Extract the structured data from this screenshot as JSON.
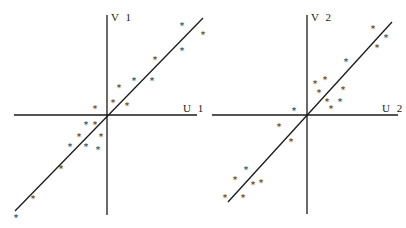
{
  "chart_data": [
    {
      "type": "scatter",
      "title": "",
      "xlabel": "U 1",
      "ylabel": "V 1",
      "grid": false,
      "legend": null,
      "axes_origin_px": [
        107,
        115
      ],
      "x_axis_px": [
        14,
        197
      ],
      "y_axis_px": [
        15,
        215
      ],
      "fit_line_px": [
        [
          15,
          211
        ],
        [
          203,
          18
        ]
      ],
      "points_px": [
        [
          182,
          25
        ],
        [
          203,
          34
        ],
        [
          182,
          50
        ],
        [
          155,
          59
        ],
        [
          134,
          80
        ],
        [
          152,
          80
        ],
        [
          119,
          87
        ],
        [
          113,
          102
        ],
        [
          127,
          105
        ],
        [
          95,
          108
        ],
        [
          86,
          124
        ],
        [
          95,
          124
        ],
        [
          79,
          136
        ],
        [
          101,
          136
        ],
        [
          70,
          146
        ],
        [
          86,
          146
        ],
        [
          98,
          149
        ],
        [
          61,
          168
        ],
        [
          33,
          198
        ],
        [
          16,
          217
        ]
      ],
      "points_relative": [
        {
          "x": 75,
          "y": 90
        },
        {
          "x": 96,
          "y": 81
        },
        {
          "x": 75,
          "y": 65
        },
        {
          "x": 48,
          "y": 56
        },
        {
          "x": 27,
          "y": 35
        },
        {
          "x": 45,
          "y": 35
        },
        {
          "x": 12,
          "y": 28
        },
        {
          "x": 6,
          "y": 13
        },
        {
          "x": 20,
          "y": 10
        },
        {
          "x": -12,
          "y": 7
        },
        {
          "x": -21,
          "y": -9
        },
        {
          "x": -12,
          "y": -9
        },
        {
          "x": -28,
          "y": -21
        },
        {
          "x": -6,
          "y": -21
        },
        {
          "x": -37,
          "y": -31
        },
        {
          "x": -21,
          "y": -31
        },
        {
          "x": -9,
          "y": -34
        },
        {
          "x": -46,
          "y": -53
        },
        {
          "x": -74,
          "y": -83
        },
        {
          "x": -91,
          "y": -102
        }
      ]
    },
    {
      "type": "scatter",
      "title": "",
      "xlabel": "U 2",
      "ylabel": "V 2",
      "grid": false,
      "legend": null,
      "axes_origin_px": [
        307,
        115
      ],
      "x_axis_px": [
        212,
        398
      ],
      "y_axis_px": [
        15,
        214
      ],
      "fit_line_px": [
        [
          228,
          202
        ],
        [
          392,
          22
        ]
      ],
      "points_px": [
        [
          373,
          28
        ],
        [
          386,
          37
        ],
        [
          377,
          47
        ],
        [
          346,
          61
        ],
        [
          315,
          83
        ],
        [
          325,
          79
        ],
        [
          319,
          92
        ],
        [
          343,
          89
        ],
        [
          327,
          101
        ],
        [
          340,
          101
        ],
        [
          331,
          108
        ],
        [
          294,
          110
        ],
        [
          279,
          126
        ],
        [
          291,
          141
        ],
        [
          246,
          169
        ],
        [
          235,
          179
        ],
        [
          253,
          184
        ],
        [
          261,
          182
        ],
        [
          225,
          197
        ],
        [
          243,
          197
        ]
      ],
      "points_relative": [
        {
          "x": 66,
          "y": 87
        },
        {
          "x": 79,
          "y": 78
        },
        {
          "x": 70,
          "y": 68
        },
        {
          "x": 39,
          "y": 54
        },
        {
          "x": 8,
          "y": 32
        },
        {
          "x": 18,
          "y": 36
        },
        {
          "x": 12,
          "y": 23
        },
        {
          "x": 36,
          "y": 26
        },
        {
          "x": 20,
          "y": 14
        },
        {
          "x": 33,
          "y": 14
        },
        {
          "x": 24,
          "y": 7
        },
        {
          "x": -13,
          "y": 5
        },
        {
          "x": -28,
          "y": -11
        },
        {
          "x": -16,
          "y": -26
        },
        {
          "x": -61,
          "y": -54
        },
        {
          "x": -72,
          "y": -64
        },
        {
          "x": -54,
          "y": -69
        },
        {
          "x": -46,
          "y": -67
        },
        {
          "x": -82,
          "y": -82
        },
        {
          "x": -64,
          "y": -82
        }
      ]
    }
  ],
  "plots": [
    {
      "v_label": "V 1",
      "u_label": "U 1",
      "marker": "*"
    },
    {
      "v_label": "V 2",
      "u_label": "U 2",
      "marker": "*"
    }
  ]
}
